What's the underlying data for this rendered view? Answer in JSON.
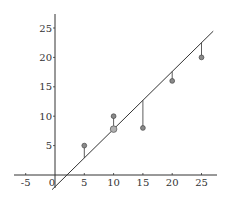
{
  "chart_data": {
    "type": "scatter",
    "title": "",
    "xlabel": "",
    "ylabel": "",
    "xlim": [
      -8,
      27
    ],
    "ylim": [
      -3,
      27
    ],
    "grid": false,
    "x_ticks": [
      -5,
      0,
      5,
      10,
      15,
      20,
      25
    ],
    "x_tick_labels": [
      "-5",
      "0",
      "5",
      "10",
      "15",
      "20",
      "25"
    ],
    "y_ticks": [
      5,
      10,
      15,
      20,
      25
    ],
    "y_tick_labels": [
      "5",
      "10",
      "15",
      "20",
      "25"
    ],
    "series": [
      {
        "name": "data points",
        "x": [
          5,
          10,
          15,
          20,
          25
        ],
        "y": [
          5,
          10,
          8,
          16,
          20
        ]
      },
      {
        "name": "highlighted point on line",
        "x": [
          10
        ],
        "y": [
          7.8
        ]
      }
    ],
    "fit_line": {
      "slope": 0.98,
      "intercept": -2.0,
      "x_range": [
        -0.5,
        27
      ]
    },
    "residual_segments": [
      {
        "x": 5,
        "y_point": 5,
        "y_line": 2.9
      },
      {
        "x": 10,
        "y_point": 10,
        "y_line": 7.8
      },
      {
        "x": 15,
        "y_point": 8,
        "y_line": 12.7
      },
      {
        "x": 20,
        "y_point": 16,
        "y_line": 17.6
      },
      {
        "x": 25,
        "y_point": 20,
        "y_line": 22.5
      }
    ],
    "colors": {
      "axis": "#333333",
      "line": "#333333",
      "point_fill": "#8a8a8a",
      "highlight_fill": "#b0b0b0"
    }
  }
}
